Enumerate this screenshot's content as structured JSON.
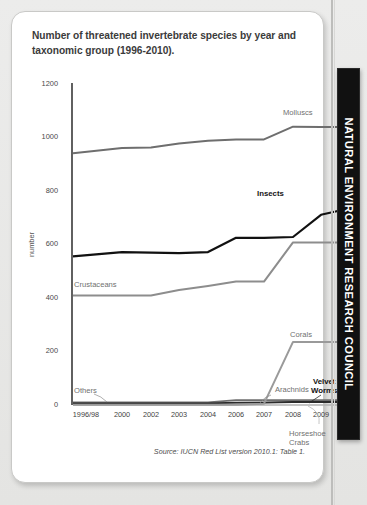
{
  "document": {
    "title": "Number of threatened invertebrate species by year and taxonomic group (1996-2010).",
    "source_note": "Source: IUCN Red List version 2010.1: Table 1.",
    "brand": "NATURAL ENVIRONMENT RESEARCH COUNCIL"
  },
  "chart_data": {
    "type": "line",
    "title": "Number of threatened invertebrate species by year and taxonomic group (1996-2010).",
    "xlabel": "",
    "ylabel": "number",
    "ylim": [
      0,
      1200
    ],
    "yticks": [
      0,
      200,
      400,
      600,
      800,
      1000,
      1200
    ],
    "ytick_labels": [
      "0",
      "200",
      "400",
      "600",
      "800",
      "1000",
      "1200"
    ],
    "categories": [
      "1996/98",
      "2000",
      "2002",
      "2003",
      "2004",
      "2006",
      "2007",
      "2008",
      "2009",
      "2010"
    ],
    "grid": false,
    "legend_position": "inline-annotations",
    "series": [
      {
        "name": "Molluscs",
        "color": "#6e6e6e",
        "values": [
          938,
          958,
          960,
          975,
          985,
          990,
          990,
          1037,
          1036,
          1036
        ]
      },
      {
        "name": "Insects",
        "color": "#111111",
        "values": [
          554,
          570,
          568,
          566,
          570,
          623,
          623,
          626,
          709,
          733
        ]
      },
      {
        "name": "Crustaceans",
        "color": "#8d8d8d",
        "values": [
          408,
          408,
          408,
          429,
          444,
          460,
          460,
          606,
          606,
          606
        ]
      },
      {
        "name": "Corals",
        "color": "#9a9a9a",
        "values": [
          1,
          1,
          1,
          1,
          1,
          1,
          5,
          235,
          235,
          235
        ]
      },
      {
        "name": "Arachnids",
        "color": "#6e6e6e",
        "values": [
          10,
          10,
          10,
          10,
          10,
          18,
          18,
          18,
          18,
          18
        ]
      },
      {
        "name": "Others",
        "color": "#a5a5a5",
        "values": [
          4,
          4,
          4,
          4,
          6,
          8,
          10,
          12,
          12,
          12
        ]
      },
      {
        "name": "Velvet Worms",
        "color": "#2b2b2b",
        "values": [
          6,
          6,
          6,
          6,
          6,
          9,
          9,
          11,
          11,
          11
        ]
      },
      {
        "name": "Horseshoe Crabs",
        "color": "#b0b0b0",
        "values": [
          0,
          0,
          0,
          0,
          0,
          0,
          0,
          0,
          0,
          0
        ]
      }
    ],
    "annotations": [
      {
        "text": "Molluscs",
        "series": "Molluscs"
      },
      {
        "text": "Insects",
        "series": "Insects"
      },
      {
        "text": "Crustaceans",
        "series": "Crustaceans"
      },
      {
        "text": "Corals",
        "series": "Corals"
      },
      {
        "text": "Arachnids",
        "series": "Arachnids"
      },
      {
        "text": "Others",
        "series": "Others"
      },
      {
        "text": "Velvet Worms",
        "series": "Velvet Worms"
      },
      {
        "text": "Horseshoe Crabs",
        "series": "Horseshoe Crabs"
      }
    ]
  },
  "axis": {
    "y_tick_0": "0",
    "y_tick_200": "200",
    "y_tick_400": "400",
    "y_tick_600": "600",
    "y_tick_800": "800",
    "y_tick_1000": "1000",
    "y_tick_1200": "1200",
    "y_axis_name": "number",
    "x_tick_0": "1996/98",
    "x_tick_1": "2000",
    "x_tick_2": "2002",
    "x_tick_3": "2003",
    "x_tick_4": "2004",
    "x_tick_5": "2006",
    "x_tick_6": "2007",
    "x_tick_7": "2008",
    "x_tick_8": "2009",
    "x_tick_9": "2010"
  },
  "labels": {
    "molluscs": "Molluscs",
    "insects": "Insects",
    "crustaceans": "Crustaceans",
    "corals": "Corals",
    "arachnids": "Arachnids",
    "others": "Others",
    "velvet_worms": "Velvet\nWorms",
    "velvet_worms_1": "Velvet",
    "velvet_worms_2": "Worms",
    "horseshoe_crabs_1": "Horseshoe",
    "horseshoe_crabs_2": "Crabs"
  }
}
